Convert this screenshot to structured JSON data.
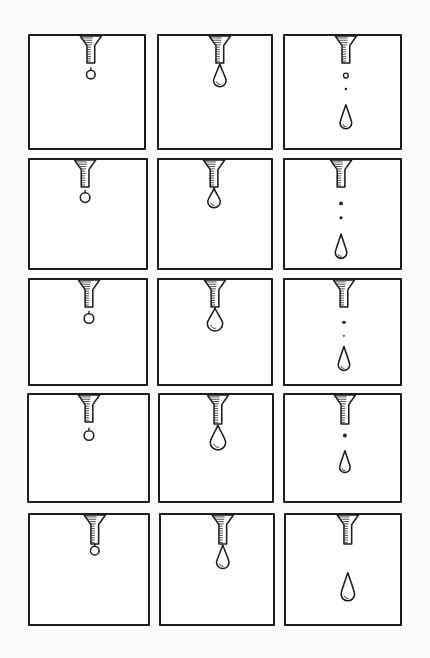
{
  "illustration": {
    "subject": "dripping nozzle sequence",
    "grid": {
      "rows": 5,
      "cols": 3
    },
    "ink_color": "#1c1c1c",
    "paper_color": "#fbfbf9",
    "panels": [
      {
        "row": 1,
        "col": 1,
        "x": 28,
        "y": 34,
        "w": 118,
        "h": 116,
        "nozzle_x": 63,
        "nozzle_len": 28,
        "drop": {
          "type": "bead",
          "y": 40,
          "r": 4.5
        },
        "falling": []
      },
      {
        "row": 1,
        "col": 2,
        "x": 157,
        "y": 34,
        "w": 116,
        "h": 116,
        "nozzle_x": 63,
        "nozzle_len": 28,
        "drop": {
          "type": "tear",
          "y": 46,
          "r": 6.5
        },
        "falling": []
      },
      {
        "row": 1,
        "col": 3,
        "x": 283,
        "y": 34,
        "w": 119,
        "h": 116,
        "nozzle_x": 63,
        "nozzle_len": 28,
        "drop": null,
        "falling": [
          {
            "type": "ring",
            "y": 41,
            "r": 2.5
          },
          {
            "type": "dot",
            "y": 55,
            "r": 1.3
          },
          {
            "type": "long",
            "y": 90,
            "r": 6
          }
        ]
      },
      {
        "row": 2,
        "col": 1,
        "x": 28,
        "y": 158,
        "w": 120,
        "h": 112,
        "nozzle_x": 57,
        "nozzle_len": 28,
        "drop": {
          "type": "bead",
          "y": 39,
          "r": 5
        },
        "falling": []
      },
      {
        "row": 2,
        "col": 2,
        "x": 157,
        "y": 158,
        "w": 116,
        "h": 112,
        "nozzle_x": 57,
        "nozzle_len": 28,
        "drop": {
          "type": "tear",
          "y": 43,
          "r": 6.5
        },
        "falling": []
      },
      {
        "row": 2,
        "col": 3,
        "x": 283,
        "y": 158,
        "w": 119,
        "h": 112,
        "nozzle_x": 58,
        "nozzle_len": 28,
        "drop": null,
        "falling": [
          {
            "type": "dot",
            "y": 45,
            "r": 2
          },
          {
            "type": "dot",
            "y": 60,
            "r": 1.6
          },
          {
            "type": "long",
            "y": 96,
            "r": 6
          }
        ]
      },
      {
        "row": 3,
        "col": 1,
        "x": 28,
        "y": 278,
        "w": 120,
        "h": 108,
        "nozzle_x": 61,
        "nozzle_len": 28,
        "drop": {
          "type": "bead",
          "y": 40,
          "r": 5
        },
        "falling": []
      },
      {
        "row": 3,
        "col": 2,
        "x": 157,
        "y": 278,
        "w": 116,
        "h": 108,
        "nozzle_x": 58,
        "nozzle_len": 28,
        "drop": {
          "type": "tear",
          "y": 45,
          "r": 8
        },
        "falling": []
      },
      {
        "row": 3,
        "col": 3,
        "x": 283,
        "y": 278,
        "w": 119,
        "h": 108,
        "nozzle_x": 61,
        "nozzle_len": 28,
        "drop": null,
        "falling": [
          {
            "type": "dot",
            "y": 44,
            "r": 1.8
          },
          {
            "type": "dot",
            "y": 58,
            "r": 1
          },
          {
            "type": "long",
            "y": 88,
            "r": 6
          }
        ]
      },
      {
        "row": 4,
        "col": 1,
        "x": 27,
        "y": 393,
        "w": 123,
        "h": 110,
        "nozzle_x": 62,
        "nozzle_len": 28,
        "drop": {
          "type": "bead",
          "y": 42,
          "r": 5
        },
        "falling": []
      },
      {
        "row": 4,
        "col": 2,
        "x": 158,
        "y": 393,
        "w": 116,
        "h": 110,
        "nozzle_x": 60,
        "nozzle_len": 30,
        "drop": {
          "type": "tear",
          "y": 49,
          "r": 8
        },
        "falling": []
      },
      {
        "row": 4,
        "col": 3,
        "x": 283,
        "y": 393,
        "w": 119,
        "h": 110,
        "nozzle_x": 62,
        "nozzle_len": 30,
        "drop": null,
        "falling": [
          {
            "type": "dot",
            "y": 42,
            "r": 2
          },
          {
            "type": "long",
            "y": 75,
            "r": 5.5
          }
        ]
      },
      {
        "row": 5,
        "col": 1,
        "x": 28,
        "y": 513,
        "w": 122,
        "h": 113,
        "nozzle_x": 67,
        "nozzle_len": 30,
        "drop": {
          "type": "bead",
          "y": 37,
          "r": 4.5
        },
        "falling": []
      },
      {
        "row": 5,
        "col": 2,
        "x": 159,
        "y": 513,
        "w": 116,
        "h": 113,
        "nozzle_x": 64,
        "nozzle_len": 30,
        "drop": {
          "type": "tear",
          "y": 49,
          "r": 6.5
        },
        "falling": []
      },
      {
        "row": 5,
        "col": 3,
        "x": 284,
        "y": 513,
        "w": 118,
        "h": 113,
        "nozzle_x": 64,
        "nozzle_len": 30,
        "drop": null,
        "falling": [
          {
            "type": "long",
            "y": 82,
            "r": 7
          }
        ]
      }
    ]
  }
}
